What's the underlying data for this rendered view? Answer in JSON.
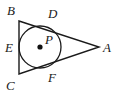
{
  "figure": {
    "type": "geometry-diagram",
    "background_color": "#ffffff",
    "stroke_color": "#1a1a1a",
    "labels": {
      "vertex_b": "B",
      "vertex_c": "C",
      "vertex_a": "A",
      "tangent_d": "D",
      "tangent_e": "E",
      "tangent_f": "F",
      "center_p": "P"
    },
    "geometry": {
      "triangle": {
        "vertex_b": [
          19,
          21
        ],
        "vertex_c": [
          19,
          74
        ],
        "vertex_a": [
          99,
          47
        ]
      },
      "circle": {
        "center": [
          40,
          47
        ],
        "radius": 21
      },
      "tangent_points": {
        "d": [
          50,
          27
        ],
        "e": [
          19,
          47
        ],
        "f": [
          50,
          68
        ]
      }
    }
  }
}
